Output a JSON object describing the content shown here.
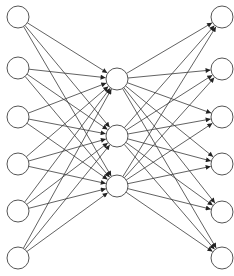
{
  "diagram": {
    "type": "neural-network",
    "style": {
      "edge_color": "#3a3a3a",
      "node_stroke": "#555555",
      "node_fill": "#ffffff",
      "background": "#ffffff",
      "node_radius": 11
    },
    "layers": [
      {
        "name": "input",
        "nodes": [
          {
            "x": 18,
            "y": 17
          },
          {
            "x": 18,
            "y": 68
          },
          {
            "x": 18,
            "y": 117
          },
          {
            "x": 18,
            "y": 164
          },
          {
            "x": 18,
            "y": 211
          },
          {
            "x": 18,
            "y": 258
          }
        ]
      },
      {
        "name": "hidden",
        "nodes": [
          {
            "x": 117,
            "y": 79
          },
          {
            "x": 117,
            "y": 136
          },
          {
            "x": 117,
            "y": 186
          }
        ]
      },
      {
        "name": "output",
        "nodes": [
          {
            "x": 222,
            "y": 17
          },
          {
            "x": 222,
            "y": 69
          },
          {
            "x": 222,
            "y": 117
          },
          {
            "x": 222,
            "y": 164
          },
          {
            "x": 222,
            "y": 212
          },
          {
            "x": 222,
            "y": 258
          }
        ]
      }
    ],
    "connections": "fully-connected with arrowheads pointing to next layer"
  }
}
